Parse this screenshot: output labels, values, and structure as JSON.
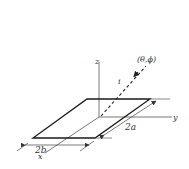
{
  "diagram": {
    "type": "geometry",
    "colors": {
      "line": "#1a1a1a",
      "axis": "#555555",
      "text": "#333333",
      "background": "#ffffff"
    },
    "labels": {
      "z_axis": "z",
      "y_axis": "y",
      "x_axis": "x",
      "incident": "i",
      "direction": "(θ,ϕ)",
      "width_dim": "2a",
      "length_dim": "2b"
    }
  }
}
